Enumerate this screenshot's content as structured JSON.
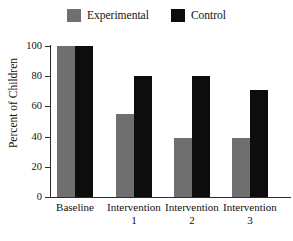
{
  "chart_data": {
    "type": "bar",
    "title": "",
    "xlabel": "",
    "ylabel": "Percent of Children",
    "ylim": [
      0,
      100
    ],
    "yticks": [
      0,
      20,
      40,
      60,
      80,
      100
    ],
    "grid": false,
    "legend_position": "top-center",
    "categories": [
      "Baseline",
      "Intervention 1",
      "Intervention 2",
      "Intervention 3"
    ],
    "category_lines": [
      {
        "line1": "Baseline",
        "line2": ""
      },
      {
        "line1": "Intervention",
        "line2": "1"
      },
      {
        "line1": "Intervention",
        "line2": "2"
      },
      {
        "line1": "Intervention",
        "line2": "3"
      }
    ],
    "series": [
      {
        "name": "Experimental",
        "color": "#6f6f6f",
        "values": [
          100,
          55,
          39,
          39
        ]
      },
      {
        "name": "Control",
        "color": "#0d0d0d",
        "values": [
          100,
          80,
          80,
          71
        ]
      }
    ]
  },
  "legend": {
    "entries": [
      {
        "label": "Experimental",
        "color": "#6f6f6f"
      },
      {
        "label": "Control",
        "color": "#0d0d0d"
      }
    ]
  },
  "axis": {
    "y_tick_labels": [
      "100",
      "80",
      "60",
      "40",
      "20",
      "0"
    ],
    "y_axis_title": "Percent of Children"
  },
  "colors": {
    "experimental": "#6f6f6f",
    "control": "#0d0d0d",
    "axis": "#2b2b2b",
    "background": "#ffffff",
    "text": "#111111"
  }
}
